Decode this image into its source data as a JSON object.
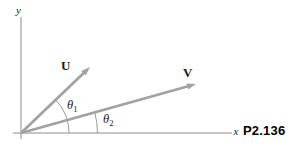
{
  "figure": {
    "title": "P2.136",
    "axis": {
      "x": "x",
      "y": "y"
    },
    "vectors": {
      "u": {
        "label": "U",
        "angle_from_x_axis_deg": 44
      },
      "v": {
        "label": "V",
        "angle_from_x_axis_deg": 16
      }
    },
    "angles": {
      "theta1": {
        "symbol": "θ",
        "sub": "1"
      },
      "theta2": {
        "symbol": "θ",
        "sub": "2"
      }
    },
    "colors": {
      "axis": "#8c8c8c",
      "vector": "#a2a2a2",
      "arc": "#8f8f8f",
      "text": "#1a1a1a",
      "figure_id": "#000000",
      "background": "#ffffff"
    }
  }
}
